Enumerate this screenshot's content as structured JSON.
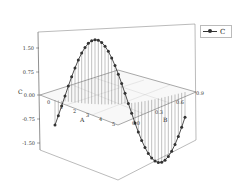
{
  "chart_data": {
    "type": "line3d",
    "title": "",
    "xlabel": "A",
    "ylabel": "B",
    "zlabel": "C",
    "x_ticks": [
      "0",
      "1",
      "2",
      "3",
      "4",
      "5",
      "6"
    ],
    "y_ticks": [
      "0.0",
      "0.3",
      "0.6",
      "0.9"
    ],
    "z_ticks": [
      "1.50",
      "0.75",
      "0.00",
      "-0.75",
      "-1.50"
    ],
    "zlim": [
      -1.5,
      1.5
    ],
    "drop_lines": true,
    "legend": [
      "C"
    ],
    "series": [
      {
        "name": "C",
        "x_range": [
          0,
          6.28
        ],
        "y_range": [
          0,
          0.9
        ],
        "description": "C = 1.5 * sin(A - 0.4) plotted along a diagonal path in the A-B plane, markers at each sample with vertical drop lines to C=0",
        "samples": 40
      }
    ]
  },
  "legend": {
    "label": "C"
  }
}
